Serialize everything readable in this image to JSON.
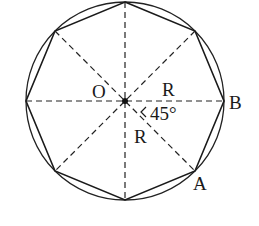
{
  "figure": {
    "type": "regular octagon inscribed in circle",
    "center_label": "O",
    "vertex_labels": {
      "A": "A",
      "B": "B"
    },
    "radius_labels": [
      "R",
      "R"
    ],
    "angle_label": "45°",
    "colors": {
      "stroke": "#1a1a1a",
      "background": "#ffffff"
    }
  }
}
